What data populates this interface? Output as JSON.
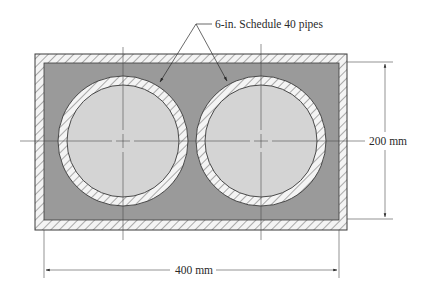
{
  "figure": {
    "callout_label": "6-in. Schedule 40 pipes",
    "height_dimension_label": "200 mm",
    "width_dimension_label": "400 mm"
  },
  "colors": {
    "background": "#ffffff",
    "fill_material": "#9a9a9a",
    "pipe_interior": "#d4d4d4",
    "hatch_background": "#f4f4f4",
    "lines": "#3a3a3a"
  },
  "geometry": {
    "outer_rect": {
      "x": 35,
      "y": 54,
      "w": 312,
      "h": 176
    },
    "inner_rect": {
      "x": 44,
      "y": 63,
      "w": 295,
      "h": 157
    },
    "pipes": [
      {
        "cx": 123,
        "cy": 141,
        "r_outer": 65,
        "r_inner": 56
      },
      {
        "cx": 261,
        "cy": 141,
        "r_outer": 65,
        "r_inner": 56
      }
    ]
  }
}
